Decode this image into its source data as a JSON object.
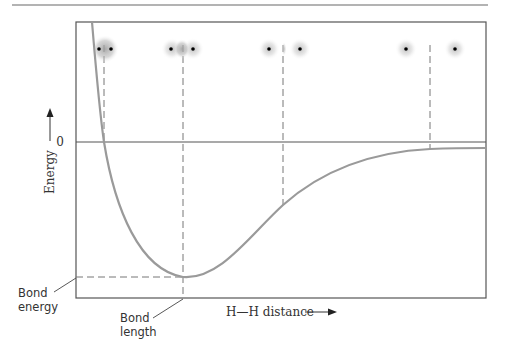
{
  "diagram": {
    "y_axis": {
      "label": "Energy",
      "zero_label": "0"
    },
    "x_axis": {
      "label": "H—H distance"
    },
    "annotations": {
      "bond_energy": [
        "Bond",
        "energy"
      ],
      "bond_length": [
        "Bond",
        "length"
      ]
    },
    "atom_pairs": [
      {
        "stage": "compressed",
        "x": 104,
        "separation": 12,
        "overlap": "strong"
      },
      {
        "stage": "bond-length",
        "x": 183,
        "separation": 32,
        "overlap": "medium"
      },
      {
        "stage": "stretched",
        "x": 283,
        "separation": 32,
        "overlap": "slight"
      },
      {
        "stage": "separated",
        "x": 430,
        "separation": 48,
        "overlap": "none"
      }
    ],
    "colors": {
      "curve": "#9a9a9a",
      "axis": "#555555",
      "dash": "#777777",
      "electron_cloud": "#a0a0a0",
      "nucleus": "#000000"
    }
  }
}
